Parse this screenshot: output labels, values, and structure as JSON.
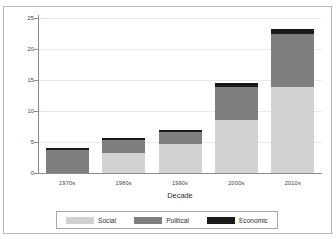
{
  "chart_data": {
    "type": "bar",
    "subtype": "stacked-bar",
    "title": "",
    "xlabel": "Decade",
    "ylabel": "",
    "categories": [
      "1970s",
      "1980s",
      "1990s",
      "2000s",
      "2010s"
    ],
    "series": [
      {
        "name": "Social",
        "color": "#d2d2d2",
        "values": [
          0.0,
          3.2,
          4.6,
          8.5,
          13.9
        ]
      },
      {
        "name": "Political",
        "color": "#7f7f7f",
        "values": [
          3.7,
          2.1,
          2.0,
          5.3,
          8.5
        ]
      },
      {
        "name": "Economic",
        "color": "#1a1a1a",
        "values": [
          0.4,
          0.3,
          0.35,
          0.7,
          0.9
        ]
      }
    ],
    "totals": [
      4.1,
      5.6,
      6.95,
      14.5,
      23.3
    ],
    "ylim": [
      0,
      25
    ],
    "yticks": [
      0,
      5,
      10,
      15,
      20,
      25
    ],
    "ytick_labels": [
      "0",
      "5",
      "10",
      "15",
      "20",
      "25"
    ],
    "grid": true,
    "legend_position": "bottom"
  },
  "axis": {
    "y_labels": [
      "25",
      "20",
      "15",
      "10",
      "5",
      "0"
    ],
    "x_labels": [
      "1970s",
      "1980s",
      "1990s",
      "2000s",
      "2010s"
    ],
    "x_title": "Decade"
  },
  "legend": {
    "entries": [
      {
        "label": "Social",
        "color": "#d2d2d2"
      },
      {
        "label": "Political",
        "color": "#7f7f7f"
      },
      {
        "label": "Economic",
        "color": "#1a1a1a"
      }
    ]
  },
  "colors": {
    "social": "#d2d2d2",
    "political": "#7f7f7f",
    "economic": "#1a1a1a",
    "axis": "#8c8c8c",
    "grid": "#e8e8e8",
    "frame": "#b9b9b9",
    "text": "#3d3d3d"
  }
}
